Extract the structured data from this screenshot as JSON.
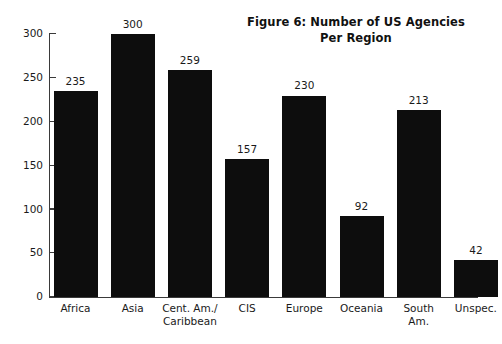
{
  "chart_data": {
    "type": "bar",
    "title": "Figure 6: Number of US Agencies\nPer Region",
    "title_line1": "Figure 6: Number of US Agencies",
    "title_line2": "Per Region",
    "xlabel": "",
    "ylabel": "",
    "ylim": [
      0,
      300
    ],
    "yticks": [
      0,
      50,
      100,
      150,
      200,
      250,
      300
    ],
    "ytick_labels": [
      "0",
      "50",
      "100",
      "150",
      "200",
      "250",
      "300"
    ],
    "grid": false,
    "legend": false,
    "bar_color": "#0d0d0d",
    "axis_color": "#3a3a3a",
    "background": "#ffffff",
    "value_labels_shown": true,
    "categories": [
      "Africa",
      "Asia",
      "Cent. Am./\nCaribbean",
      "CIS",
      "Europe",
      "Oceania",
      "South\nAm.",
      "Unspec."
    ],
    "values": [
      235,
      300,
      259,
      157,
      230,
      92,
      213,
      42
    ],
    "points": [
      {
        "category": "Africa",
        "value": 235,
        "label": "235"
      },
      {
        "category": "Asia",
        "value": 300,
        "label": "300"
      },
      {
        "category": "Cent. Am./Caribbean",
        "value": 259,
        "label": "259"
      },
      {
        "category": "CIS",
        "value": 157,
        "label": "157"
      },
      {
        "category": "Europe",
        "value": 230,
        "label": "230"
      },
      {
        "category": "Oceania",
        "value": 92,
        "label": "92"
      },
      {
        "category": "South Am.",
        "value": 213,
        "label": "213"
      },
      {
        "category": "Unspec.",
        "value": 42,
        "label": "42"
      }
    ]
  }
}
